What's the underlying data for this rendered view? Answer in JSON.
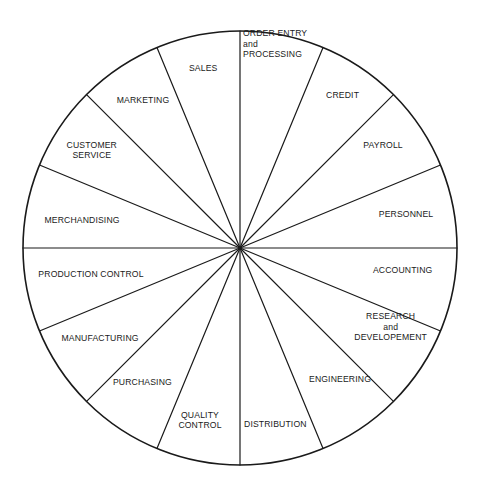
{
  "diagram": {
    "shape": "circle",
    "segment_count": 16,
    "segment_angle_degrees": 22.5,
    "stroke_color": "#1a1a1a",
    "fill_color": "#ffffff",
    "text_color": "#1a1a1a",
    "geometry": {
      "center_x": 240,
      "center_y": 248,
      "radius": 217,
      "outline_width": 1.6,
      "spoke_width": 1.2
    },
    "segments": [
      {
        "name": "order-entry-and-processing",
        "lines": [
          "ORDER ENTRY",
          "and",
          "PROCESSING"
        ],
        "x": 240,
        "y": 44,
        "align": "l",
        "offset_x": 3
      },
      {
        "name": "credit",
        "lines": [
          "CREDIT"
        ],
        "x": 342,
        "y": 95,
        "align": "c",
        "offset_x": 0
      },
      {
        "name": "payroll",
        "lines": [
          "PAYROLL"
        ],
        "x": 383,
        "y": 145,
        "align": "c",
        "offset_x": 0
      },
      {
        "name": "personnel",
        "lines": [
          "PERSONNEL"
        ],
        "x": 406,
        "y": 214,
        "align": "c",
        "offset_x": 0
      },
      {
        "name": "accounting",
        "lines": [
          "ACCOUNTING"
        ],
        "x": 402,
        "y": 270,
        "align": "c",
        "offset_x": 0
      },
      {
        "name": "research-and-developement",
        "lines": [
          "RESEARCH",
          "and",
          "DEVELOPEMENT"
        ],
        "x": 390,
        "y": 327,
        "align": "c",
        "offset_x": 0
      },
      {
        "name": "engineering",
        "lines": [
          "ENGINEERING"
        ],
        "x": 340,
        "y": 379,
        "align": "c",
        "offset_x": 0
      },
      {
        "name": "distribution",
        "lines": [
          "DISTRIBUTION"
        ],
        "x": 242,
        "y": 424,
        "align": "l",
        "offset_x": 2
      },
      {
        "name": "quality-control",
        "lines": [
          "QUALITY",
          "CONTROL"
        ],
        "x": 200,
        "y": 420,
        "align": "c",
        "offset_x": 0
      },
      {
        "name": "purchasing",
        "lines": [
          "PURCHASING"
        ],
        "x": 142,
        "y": 382,
        "align": "c",
        "offset_x": 0
      },
      {
        "name": "manufacturing",
        "lines": [
          "MANUFACTURING"
        ],
        "x": 100,
        "y": 338,
        "align": "c",
        "offset_x": 0
      },
      {
        "name": "production-control",
        "lines": [
          "PRODUCTION CONTROL"
        ],
        "x": 91,
        "y": 274,
        "align": "c",
        "offset_x": 0
      },
      {
        "name": "merchandising",
        "lines": [
          "MERCHANDISING"
        ],
        "x": 82,
        "y": 220,
        "align": "c",
        "offset_x": 0
      },
      {
        "name": "customer-service",
        "lines": [
          "CUSTOMER",
          "SERVICE"
        ],
        "x": 92,
        "y": 150,
        "align": "c",
        "offset_x": 0
      },
      {
        "name": "marketing",
        "lines": [
          "MARKETING"
        ],
        "x": 143,
        "y": 100,
        "align": "c",
        "offset_x": 0
      },
      {
        "name": "sales",
        "lines": [
          "SALES"
        ],
        "x": 203,
        "y": 68,
        "align": "c",
        "offset_x": 0
      }
    ]
  }
}
